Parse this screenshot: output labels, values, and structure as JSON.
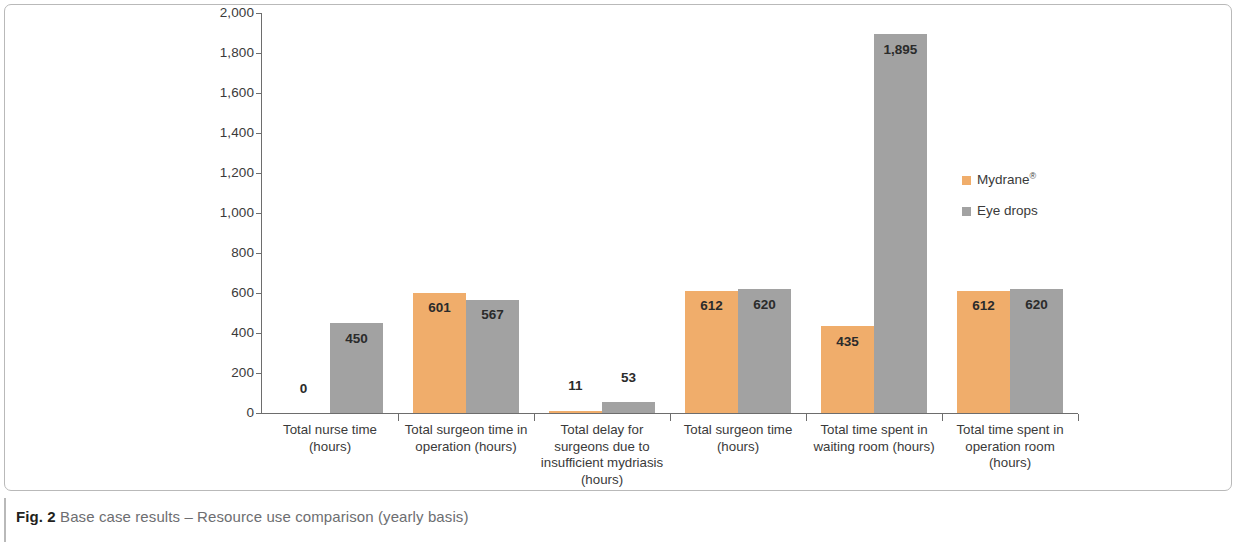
{
  "figure": {
    "caption_label": "Fig. 2",
    "caption_text": " Base case results – Resource use comparison (yearly basis)"
  },
  "legend": {
    "position": "right-middle",
    "items": [
      {
        "name": "Mydrane",
        "suffix": "®",
        "color": "#f0ad6b"
      },
      {
        "name": "Eye drops",
        "suffix": "",
        "color": "#a2a2a2"
      }
    ]
  },
  "chart_data": {
    "type": "bar",
    "title": "",
    "subtitle": "",
    "xlabel": "",
    "ylabel": "",
    "ylim": [
      0,
      2000
    ],
    "grid": false,
    "legend_position": "right",
    "ytick_labels": [
      "0",
      "200",
      "400",
      "600",
      "800",
      "1,000",
      "1,200",
      "1,400",
      "1,600",
      "1,800",
      "2,000"
    ],
    "ytick_values": [
      0,
      200,
      400,
      600,
      800,
      1000,
      1200,
      1400,
      1600,
      1800,
      2000
    ],
    "categories": [
      "Total nurse time (hours)",
      "Total surgeon time in operation (hours)",
      "Total delay for surgeons due to insufficient mydriasis (hours)",
      "Total surgeon time (hours)",
      "Total time spent in waiting room (hours)",
      "Total time spent in operation room (hours)"
    ],
    "category_lines": [
      [
        "Total nurse time",
        "(hours)"
      ],
      [
        "Total surgeon time in",
        "operation (hours)"
      ],
      [
        "Total delay for",
        "surgeons due to",
        "insufficient mydriasis",
        "(hours)"
      ],
      [
        "Total surgeon time",
        "(hours)"
      ],
      [
        "Total time spent in",
        "waiting room (hours)"
      ],
      [
        "Total time spent in",
        "operation room",
        "(hours)"
      ]
    ],
    "series": [
      {
        "name": "Mydrane®",
        "color": "#f0ad6b",
        "values": [
          0,
          601,
          11,
          612,
          435,
          612
        ],
        "labels": [
          "0",
          "601",
          "11",
          "612",
          "435",
          "612"
        ]
      },
      {
        "name": "Eye drops",
        "color": "#a2a2a2",
        "values": [
          450,
          567,
          53,
          620,
          1895,
          620
        ],
        "labels": [
          "450",
          "567",
          "53",
          "620",
          "1,895",
          "620"
        ]
      }
    ]
  }
}
